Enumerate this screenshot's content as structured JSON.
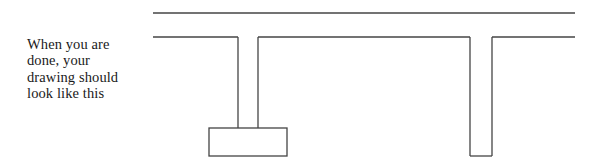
{
  "figure": {
    "background_color": "#ffffff",
    "caption": {
      "lines": [
        "When you are",
        "done, your",
        "drawing should",
        "look like this"
      ],
      "text_color": "#1a1a1a"
    },
    "drawing": {
      "name": "i-beam-section-outline",
      "stroke_color": "#444444",
      "stroke_width": 1.3,
      "fill": "none",
      "elements": [
        {
          "name": "top-rule",
          "type": "line",
          "x1": 153,
          "y1": 13,
          "x2": 575,
          "y2": 13
        },
        {
          "name": "second-rule-left-segment",
          "type": "line",
          "x1": 153,
          "y1": 37,
          "x2": 238,
          "y2": 37
        },
        {
          "name": "second-rule-middle-segment",
          "type": "line",
          "x1": 258,
          "y1": 37,
          "x2": 470,
          "y2": 37
        },
        {
          "name": "second-rule-right-segment",
          "type": "line",
          "x1": 492,
          "y1": 37,
          "x2": 575,
          "y2": 37
        },
        {
          "name": "left-web-inner-vertical",
          "type": "line",
          "x1": 238,
          "y1": 37,
          "x2": 238,
          "y2": 128
        },
        {
          "name": "left-web-outer-vertical",
          "type": "line",
          "x1": 258,
          "y1": 37,
          "x2": 258,
          "y2": 128
        },
        {
          "name": "foot-rectangle",
          "type": "rect",
          "x": 209,
          "y": 128,
          "width": 78,
          "height": 28
        },
        {
          "name": "right-notch-left-vertical",
          "type": "line",
          "x1": 470,
          "y1": 37,
          "x2": 470,
          "y2": 156
        },
        {
          "name": "right-notch-right-vertical",
          "type": "line",
          "x1": 492,
          "y1": 37,
          "x2": 492,
          "y2": 156
        },
        {
          "name": "right-notch-bottom",
          "type": "line",
          "x1": 470,
          "y1": 156,
          "x2": 492,
          "y2": 156
        }
      ]
    }
  }
}
